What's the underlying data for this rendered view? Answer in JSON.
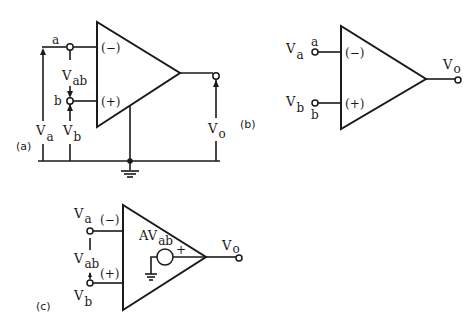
{
  "figure": {
    "colors": {
      "ink": "#1a1a1a",
      "background": "#ffffff"
    },
    "panel_a": {
      "caption": "(a)",
      "terminal_a": "a",
      "terminal_b": "b",
      "inverting_label": "(−)",
      "noninverting_label": "(+)",
      "va_main": "V",
      "va_sub": "a",
      "vb_main": "V",
      "vb_sub": "b",
      "vab_main": "V",
      "vab_sub": "ab",
      "vo_main": "V",
      "vo_sub": "o"
    },
    "panel_b": {
      "caption": "(b)",
      "terminal_a": "a",
      "terminal_b": "b",
      "inverting_label": "(−)",
      "noninverting_label": "(+)",
      "va_main": "V",
      "va_sub": "a",
      "vb_main": "V",
      "vb_sub": "b",
      "vo_main": "V",
      "vo_sub": "o"
    },
    "panel_c": {
      "caption": "(c)",
      "inverting_label": "(−)",
      "noninverting_label": "(+)",
      "va_main": "V",
      "va_sub": "a",
      "vb_main": "V",
      "vb_sub": "b",
      "vab_main": "V",
      "vab_sub": "ab",
      "source_main": "AV",
      "source_sub": "ab",
      "source_polarity": "+",
      "vo_main": "V",
      "vo_sub": "o"
    }
  }
}
